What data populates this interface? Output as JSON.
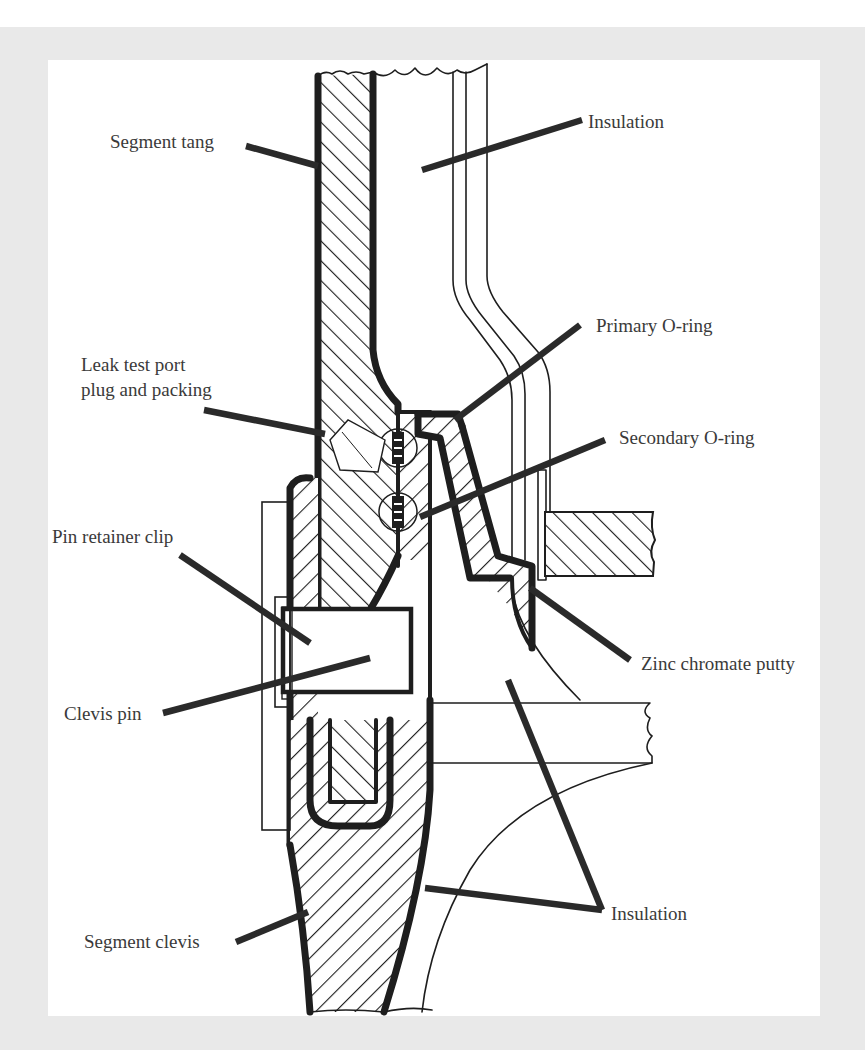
{
  "figure": {
    "colors": {
      "frame_background": "#e9e9e9",
      "panel_background": "#ffffff",
      "line": "#1e1e1e",
      "label_text": "#3a3a3a"
    }
  },
  "labels": {
    "segment_tang": "Segment tang",
    "insulation_top": "Insulation",
    "primary_o_ring": "Primary O-ring",
    "leak_test_port_line1": "Leak test port",
    "leak_test_port_line2": "plug and packing",
    "secondary_o_ring": "Secondary O-ring",
    "pin_retainer_clip": "Pin retainer clip",
    "zinc_chromate_putty": "Zinc chromate putty",
    "clevis_pin": "Clevis pin",
    "insulation_bottom": "Insulation",
    "segment_clevis": "Segment clevis"
  }
}
